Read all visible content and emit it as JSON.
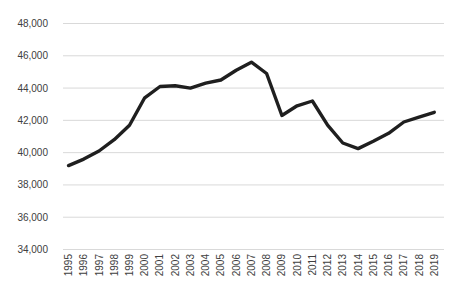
{
  "chart_data": {
    "type": "line",
    "title": "",
    "xlabel": "",
    "ylabel": "",
    "categories": [
      "1995",
      "1996",
      "1997",
      "1998",
      "1999",
      "2000",
      "2001",
      "2002",
      "2003",
      "2004",
      "2005",
      "2006",
      "2007",
      "2008",
      "2009",
      "2010",
      "2011",
      "2012",
      "2013",
      "2014",
      "2015",
      "2016",
      "2017",
      "2018",
      "2019"
    ],
    "series": [
      {
        "name": "series-1",
        "values": [
          39200,
          39600,
          40100,
          40800,
          41700,
          43400,
          44100,
          44150,
          44000,
          44300,
          44500,
          45100,
          45600,
          44900,
          42300,
          42900,
          43200,
          41700,
          40600,
          40250,
          40700,
          41200,
          41900,
          42200,
          42500
        ]
      }
    ],
    "ylim": [
      34000,
      48000
    ],
    "ytick_step": 2000,
    "ytick_labels": [
      "34,000",
      "36,000",
      "38,000",
      "40,000",
      "42,000",
      "44,000",
      "46,000",
      "48,000"
    ],
    "grid": "horizontal",
    "legend": "none",
    "colors": {
      "line": "#1f1f1f",
      "grid": "#d9d9d9",
      "axis_label": "#404040",
      "background": "#ffffff"
    },
    "style": {
      "line_width": 3.4,
      "x_label_rotation": -90
    }
  }
}
